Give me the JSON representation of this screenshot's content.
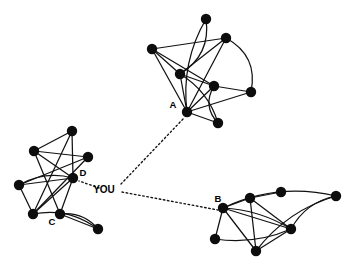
{
  "diagram": {
    "type": "node-link-graph",
    "colors": {
      "node": "#0d0d0d",
      "edge": "#121212",
      "bridge": "#111111",
      "background": "#ffffff",
      "label": "#000000"
    },
    "canvas": {
      "width": 356,
      "height": 267
    },
    "node_radius": 5.2,
    "ego": {
      "label": "YOU",
      "label_x": 104,
      "label_y": 190,
      "hub_x": 121,
      "hub_y": 190
    },
    "labels": [
      {
        "name": "label-a",
        "text": "A",
        "x": 173,
        "y": 105
      },
      {
        "name": "label-b",
        "text": "B",
        "x": 218,
        "y": 199
      },
      {
        "name": "label-c",
        "text": "C",
        "x": 52,
        "y": 222
      },
      {
        "name": "label-d",
        "text": "D",
        "x": 83,
        "y": 173
      }
    ],
    "clusters": [
      {
        "name": "cluster-a",
        "anchor": "A",
        "nodes": [
          {
            "id": "a0",
            "x": 206,
            "y": 19
          },
          {
            "id": "a1",
            "x": 226,
            "y": 38
          },
          {
            "id": "a2",
            "x": 152,
            "y": 49
          },
          {
            "id": "a3",
            "x": 180,
            "y": 74
          },
          {
            "id": "a4",
            "x": 214,
            "y": 86
          },
          {
            "id": "a5",
            "x": 251,
            "y": 92
          },
          {
            "id": "a6",
            "x": 187,
            "y": 112
          },
          {
            "id": "a7",
            "x": 218,
            "y": 123
          }
        ],
        "straight_edges": [
          [
            "a2",
            "a1"
          ],
          [
            "a2",
            "a3"
          ],
          [
            "a2",
            "a4"
          ],
          [
            "a2",
            "a6"
          ],
          [
            "a1",
            "a3"
          ],
          [
            "a1",
            "a6"
          ],
          [
            "a3",
            "a4"
          ],
          [
            "a3",
            "a6"
          ],
          [
            "a4",
            "a5"
          ],
          [
            "a4",
            "a6"
          ],
          [
            "a6",
            "a5"
          ],
          [
            "a6",
            "a7"
          ]
        ],
        "curved_edges": [
          {
            "from": "a0",
            "to": "a3",
            "bow": -20
          },
          {
            "from": "a0",
            "to": "a6",
            "bow": 16
          },
          {
            "from": "a1",
            "to": "a5",
            "bow": -22
          },
          {
            "from": "a4",
            "to": "a7",
            "bow": 14
          },
          {
            "from": "a3",
            "to": "a7",
            "bow": -12
          }
        ]
      },
      {
        "name": "cluster-b",
        "anchor": "B",
        "nodes": [
          {
            "id": "b0",
            "x": 223,
            "y": 208
          },
          {
            "id": "b1",
            "x": 250,
            "y": 198
          },
          {
            "id": "b2",
            "x": 281,
            "y": 192
          },
          {
            "id": "b3",
            "x": 336,
            "y": 196
          },
          {
            "id": "b4",
            "x": 291,
            "y": 229
          },
          {
            "id": "b5",
            "x": 215,
            "y": 239
          },
          {
            "id": "b6",
            "x": 256,
            "y": 251
          }
        ],
        "straight_edges": [
          [
            "b0",
            "b1"
          ],
          [
            "b1",
            "b2"
          ],
          [
            "b0",
            "b4"
          ],
          [
            "b0",
            "b5"
          ],
          [
            "b0",
            "b6"
          ],
          [
            "b1",
            "b4"
          ],
          [
            "b1",
            "b6"
          ],
          [
            "b4",
            "b6"
          ]
        ],
        "curved_edges": [
          {
            "from": "b0",
            "to": "b3",
            "bow": -20
          },
          {
            "from": "b3",
            "to": "b4",
            "bow": 13
          },
          {
            "from": "b3",
            "to": "b6",
            "bow": 16
          },
          {
            "from": "b5",
            "to": "b4",
            "bow": 11
          },
          {
            "from": "b0",
            "to": "b4",
            "bow": -9
          }
        ]
      },
      {
        "name": "cluster-cd",
        "anchor": "D",
        "nodes": [
          {
            "id": "c0",
            "x": 72,
            "y": 131
          },
          {
            "id": "c1",
            "x": 34,
            "y": 151
          },
          {
            "id": "c2",
            "x": 88,
            "y": 157
          },
          {
            "id": "c3",
            "x": 73,
            "y": 178
          },
          {
            "id": "c4",
            "x": 19,
            "y": 185
          },
          {
            "id": "c5",
            "x": 33,
            "y": 214
          },
          {
            "id": "c6",
            "x": 60,
            "y": 214
          },
          {
            "id": "c7",
            "x": 98,
            "y": 229
          }
        ],
        "straight_edges": [
          [
            "c0",
            "c3"
          ],
          [
            "c0",
            "c5"
          ],
          [
            "c1",
            "c2"
          ],
          [
            "c1",
            "c3"
          ],
          [
            "c1",
            "c6"
          ],
          [
            "c2",
            "c4"
          ],
          [
            "c2",
            "c5"
          ],
          [
            "c3",
            "c4"
          ],
          [
            "c3",
            "c5"
          ],
          [
            "c3",
            "c6"
          ],
          [
            "c4",
            "c5"
          ],
          [
            "c6",
            "c7"
          ],
          [
            "c0",
            "c1"
          ]
        ],
        "curved_edges": [
          {
            "from": "c4",
            "to": "c3",
            "bow": -11
          },
          {
            "from": "c5",
            "to": "c7",
            "bow": -15
          },
          {
            "from": "c6",
            "to": "c7",
            "bow": -11
          }
        ]
      }
    ],
    "bridges": [
      {
        "name": "bridge-you-to-a",
        "from_x": 121,
        "from_y": 184,
        "to_x": 184,
        "to_y": 118
      },
      {
        "name": "bridge-you-to-b",
        "from_x": 122,
        "from_y": 192,
        "to_x": 218,
        "to_y": 210
      },
      {
        "name": "bridge-you-to-d",
        "from_x": 99,
        "from_y": 188,
        "to_x": 79,
        "to_y": 181
      }
    ]
  }
}
